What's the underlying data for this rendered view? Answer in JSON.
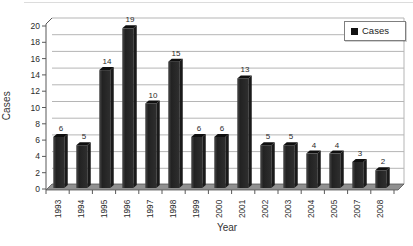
{
  "chart_data": {
    "type": "bar",
    "title": "",
    "categories": [
      "1993",
      "1994",
      "1995",
      "1996",
      "1997",
      "1998",
      "1999",
      "2000",
      "2001",
      "2002",
      "2003",
      "2004",
      "2005",
      "2007",
      "2008"
    ],
    "values": [
      6,
      5,
      14,
      19,
      10,
      15,
      6,
      6,
      13,
      5,
      5,
      4,
      4,
      3,
      2
    ],
    "xlabel": "Year",
    "ylabel": "Cases",
    "ylim": [
      0,
      20
    ],
    "ytick_step": 2,
    "grid": true,
    "style": "pseudo-3d-columns",
    "legend": {
      "label": "Cases",
      "position": "top-right"
    },
    "colors": {
      "bar_front": "#2e2e2e",
      "bar_front_highlight": "#4a4a4a",
      "bar_side": "#1a1a1a",
      "bar_cap": "#0f0f0f",
      "floor": "#909090",
      "floor_edge": "#4d4d4d",
      "gridline": "#b5b5b5",
      "axis": "#595959",
      "text": "#2b2b2b",
      "background": "#ffffff"
    }
  }
}
